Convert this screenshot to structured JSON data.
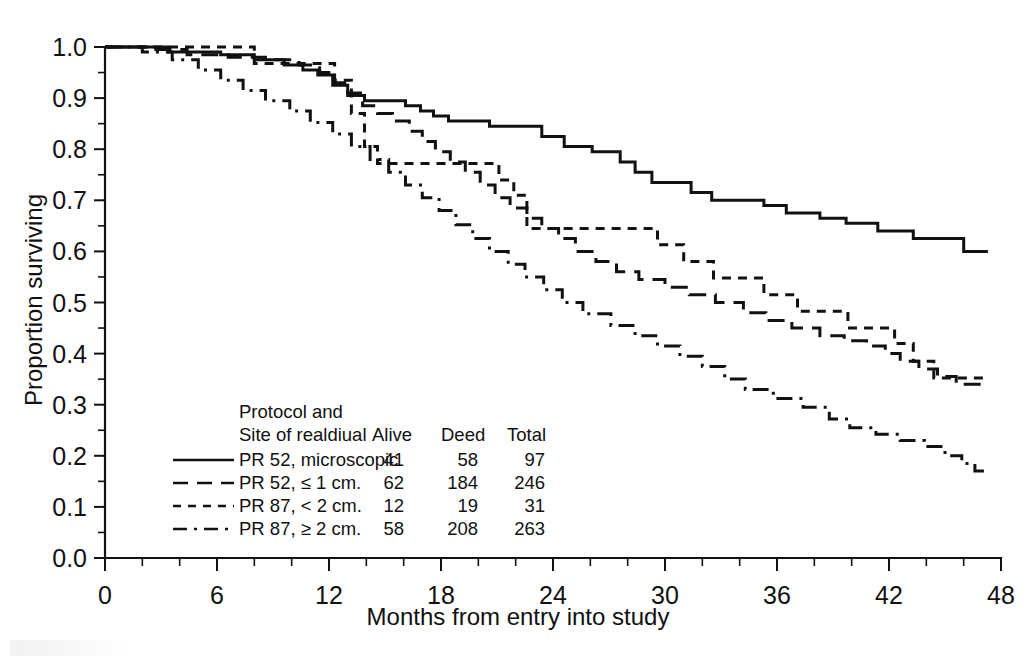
{
  "chart_data": {
    "type": "line",
    "title": "",
    "xlabel": "Months from entry into study",
    "ylabel": "Proportion surviving",
    "xlim": [
      0,
      48
    ],
    "ylim": [
      0.0,
      1.0
    ],
    "xticks": [
      0,
      6,
      12,
      18,
      24,
      30,
      36,
      42,
      48
    ],
    "xtick_labels": [
      "0",
      "6",
      "12",
      "18",
      "24",
      "30",
      "36",
      "42",
      "48"
    ],
    "x_minor_step": 2,
    "yticks": [
      0.0,
      0.1,
      0.2,
      0.3,
      0.4,
      0.5,
      0.6,
      0.7,
      0.8,
      0.9,
      1.0
    ],
    "ytick_labels": [
      "0.0",
      "0.1",
      "0.2",
      "0.3",
      "0.4",
      "0.5",
      "0.6",
      "0.7",
      "0.8",
      "0.9",
      "1.0"
    ],
    "y_minor_step": 0.05,
    "grid": false,
    "legend_position": "lower-left-inset",
    "series": [
      {
        "name": "PR 52, microscopic",
        "style": "solid",
        "points": [
          [
            0,
            1.0
          ],
          [
            3.4,
            1.0
          ],
          [
            3.4,
            0.99
          ],
          [
            6.2,
            0.99
          ],
          [
            6.2,
            0.985
          ],
          [
            8.0,
            0.985
          ],
          [
            8.0,
            0.975
          ],
          [
            9.6,
            0.975
          ],
          [
            9.6,
            0.965
          ],
          [
            10.6,
            0.965
          ],
          [
            10.6,
            0.955
          ],
          [
            11.4,
            0.955
          ],
          [
            11.4,
            0.945
          ],
          [
            12.2,
            0.945
          ],
          [
            12.2,
            0.925
          ],
          [
            13.0,
            0.925
          ],
          [
            13.0,
            0.905
          ],
          [
            13.9,
            0.905
          ],
          [
            13.9,
            0.895
          ],
          [
            16.1,
            0.895
          ],
          [
            16.1,
            0.885
          ],
          [
            16.9,
            0.885
          ],
          [
            16.9,
            0.875
          ],
          [
            17.6,
            0.875
          ],
          [
            17.6,
            0.865
          ],
          [
            18.4,
            0.865
          ],
          [
            18.4,
            0.855
          ],
          [
            20.6,
            0.855
          ],
          [
            20.6,
            0.845
          ],
          [
            23.4,
            0.845
          ],
          [
            23.4,
            0.825
          ],
          [
            24.6,
            0.825
          ],
          [
            24.6,
            0.805
          ],
          [
            26.1,
            0.805
          ],
          [
            26.1,
            0.795
          ],
          [
            27.6,
            0.795
          ],
          [
            27.6,
            0.775
          ],
          [
            28.4,
            0.775
          ],
          [
            28.4,
            0.755
          ],
          [
            29.3,
            0.755
          ],
          [
            29.3,
            0.735
          ],
          [
            31.4,
            0.735
          ],
          [
            31.4,
            0.715
          ],
          [
            32.5,
            0.715
          ],
          [
            32.5,
            0.7
          ],
          [
            35.3,
            0.7
          ],
          [
            35.3,
            0.69
          ],
          [
            36.5,
            0.69
          ],
          [
            36.5,
            0.675
          ],
          [
            38.3,
            0.675
          ],
          [
            38.3,
            0.665
          ],
          [
            39.7,
            0.665
          ],
          [
            39.7,
            0.655
          ],
          [
            41.4,
            0.655
          ],
          [
            41.4,
            0.64
          ],
          [
            43.3,
            0.64
          ],
          [
            43.3,
            0.625
          ],
          [
            46.0,
            0.625
          ],
          [
            46.0,
            0.6
          ],
          [
            47.3,
            0.6
          ]
        ],
        "alive": 41,
        "dead": 58,
        "total": 97,
        "end_value": 0.6
      },
      {
        "name": "PR 52, ≤ 1 cm.",
        "style": "long-dash",
        "points": [
          [
            0,
            1.0
          ],
          [
            2.4,
            1.0
          ],
          [
            2.4,
            0.995
          ],
          [
            4.4,
            0.995
          ],
          [
            4.4,
            0.985
          ],
          [
            6.6,
            0.985
          ],
          [
            6.6,
            0.98
          ],
          [
            8.6,
            0.98
          ],
          [
            8.6,
            0.975
          ],
          [
            10.4,
            0.975
          ],
          [
            10.4,
            0.965
          ],
          [
            11.5,
            0.965
          ],
          [
            11.5,
            0.95
          ],
          [
            12.3,
            0.95
          ],
          [
            12.3,
            0.93
          ],
          [
            13.0,
            0.93
          ],
          [
            13.0,
            0.91
          ],
          [
            13.8,
            0.91
          ],
          [
            13.8,
            0.885
          ],
          [
            14.6,
            0.885
          ],
          [
            14.6,
            0.87
          ],
          [
            15.4,
            0.87
          ],
          [
            15.4,
            0.855
          ],
          [
            16.3,
            0.855
          ],
          [
            16.3,
            0.835
          ],
          [
            17.0,
            0.835
          ],
          [
            17.0,
            0.815
          ],
          [
            17.7,
            0.815
          ],
          [
            17.7,
            0.795
          ],
          [
            18.5,
            0.795
          ],
          [
            18.5,
            0.775
          ],
          [
            19.3,
            0.775
          ],
          [
            19.3,
            0.755
          ],
          [
            20.1,
            0.755
          ],
          [
            20.1,
            0.73
          ],
          [
            20.9,
            0.73
          ],
          [
            20.9,
            0.705
          ],
          [
            21.7,
            0.705
          ],
          [
            21.7,
            0.685
          ],
          [
            22.6,
            0.685
          ],
          [
            22.6,
            0.665
          ],
          [
            23.4,
            0.665
          ],
          [
            23.4,
            0.645
          ],
          [
            24.3,
            0.645
          ],
          [
            24.3,
            0.625
          ],
          [
            25.2,
            0.625
          ],
          [
            25.2,
            0.6
          ],
          [
            26.3,
            0.6
          ],
          [
            26.3,
            0.58
          ],
          [
            27.4,
            0.58
          ],
          [
            27.4,
            0.56
          ],
          [
            28.6,
            0.56
          ],
          [
            28.6,
            0.545
          ],
          [
            30.0,
            0.545
          ],
          [
            30.0,
            0.53
          ],
          [
            31.3,
            0.53
          ],
          [
            31.3,
            0.515
          ],
          [
            32.7,
            0.515
          ],
          [
            32.7,
            0.5
          ],
          [
            34.2,
            0.5
          ],
          [
            34.2,
            0.48
          ],
          [
            35.4,
            0.48
          ],
          [
            35.4,
            0.465
          ],
          [
            36.8,
            0.465
          ],
          [
            36.8,
            0.45
          ],
          [
            38.3,
            0.45
          ],
          [
            38.3,
            0.435
          ],
          [
            39.6,
            0.435
          ],
          [
            39.6,
            0.425
          ],
          [
            40.8,
            0.425
          ],
          [
            40.8,
            0.415
          ],
          [
            41.8,
            0.415
          ],
          [
            41.8,
            0.4
          ],
          [
            42.6,
            0.4
          ],
          [
            42.6,
            0.385
          ],
          [
            43.6,
            0.385
          ],
          [
            43.6,
            0.37
          ],
          [
            44.6,
            0.37
          ],
          [
            44.6,
            0.355
          ],
          [
            45.6,
            0.355
          ],
          [
            45.6,
            0.34
          ],
          [
            47.3,
            0.34
          ]
        ],
        "alive": 62,
        "dead": 184,
        "total": 246,
        "end_value": 0.34
      },
      {
        "name": "PR 87, < 2 cm.",
        "style": "short-dash",
        "points": [
          [
            0,
            1.0
          ],
          [
            8.0,
            1.0
          ],
          [
            8.0,
            0.968
          ],
          [
            12.3,
            0.968
          ],
          [
            12.3,
            0.935
          ],
          [
            13.2,
            0.935
          ],
          [
            13.2,
            0.87
          ],
          [
            13.9,
            0.87
          ],
          [
            13.9,
            0.805
          ],
          [
            14.6,
            0.805
          ],
          [
            14.6,
            0.772
          ],
          [
            21.1,
            0.772
          ],
          [
            21.1,
            0.74
          ],
          [
            21.9,
            0.74
          ],
          [
            21.9,
            0.71
          ],
          [
            22.6,
            0.71
          ],
          [
            22.6,
            0.645
          ],
          [
            29.6,
            0.645
          ],
          [
            29.6,
            0.613
          ],
          [
            31.0,
            0.613
          ],
          [
            31.0,
            0.58
          ],
          [
            32.6,
            0.58
          ],
          [
            32.6,
            0.548
          ],
          [
            35.3,
            0.548
          ],
          [
            35.3,
            0.515
          ],
          [
            37.1,
            0.515
          ],
          [
            37.1,
            0.483
          ],
          [
            39.8,
            0.483
          ],
          [
            39.8,
            0.45
          ],
          [
            42.3,
            0.45
          ],
          [
            42.3,
            0.42
          ],
          [
            43.3,
            0.42
          ],
          [
            43.3,
            0.385
          ],
          [
            44.4,
            0.385
          ],
          [
            44.4,
            0.352
          ],
          [
            47.3,
            0.352
          ]
        ],
        "alive": 12,
        "dead": 19,
        "total": 31,
        "end_value": 0.35
      },
      {
        "name": "PR 87, ≥ 2 cm.",
        "style": "dash-dot",
        "points": [
          [
            0,
            1.0
          ],
          [
            2.0,
            1.0
          ],
          [
            2.0,
            0.99
          ],
          [
            3.6,
            0.99
          ],
          [
            3.6,
            0.975
          ],
          [
            5.0,
            0.975
          ],
          [
            5.0,
            0.955
          ],
          [
            6.2,
            0.955
          ],
          [
            6.2,
            0.935
          ],
          [
            7.4,
            0.935
          ],
          [
            7.4,
            0.915
          ],
          [
            8.6,
            0.915
          ],
          [
            8.6,
            0.895
          ],
          [
            9.9,
            0.895
          ],
          [
            9.9,
            0.875
          ],
          [
            11.0,
            0.875
          ],
          [
            11.0,
            0.852
          ],
          [
            12.2,
            0.852
          ],
          [
            12.2,
            0.83
          ],
          [
            13.2,
            0.83
          ],
          [
            13.2,
            0.805
          ],
          [
            14.2,
            0.805
          ],
          [
            14.2,
            0.78
          ],
          [
            15.2,
            0.78
          ],
          [
            15.2,
            0.755
          ],
          [
            16.1,
            0.755
          ],
          [
            16.1,
            0.73
          ],
          [
            17.0,
            0.73
          ],
          [
            17.0,
            0.705
          ],
          [
            17.9,
            0.705
          ],
          [
            17.9,
            0.68
          ],
          [
            18.8,
            0.68
          ],
          [
            18.8,
            0.652
          ],
          [
            19.7,
            0.652
          ],
          [
            19.7,
            0.625
          ],
          [
            20.6,
            0.625
          ],
          [
            20.6,
            0.6
          ],
          [
            21.6,
            0.6
          ],
          [
            21.6,
            0.575
          ],
          [
            22.5,
            0.575
          ],
          [
            22.5,
            0.55
          ],
          [
            23.5,
            0.55
          ],
          [
            23.5,
            0.525
          ],
          [
            24.5,
            0.525
          ],
          [
            24.5,
            0.5
          ],
          [
            25.6,
            0.5
          ],
          [
            25.6,
            0.478
          ],
          [
            27.1,
            0.478
          ],
          [
            27.1,
            0.455
          ],
          [
            28.4,
            0.455
          ],
          [
            28.4,
            0.435
          ],
          [
            29.6,
            0.435
          ],
          [
            29.6,
            0.415
          ],
          [
            30.8,
            0.415
          ],
          [
            30.8,
            0.395
          ],
          [
            32.0,
            0.395
          ],
          [
            32.0,
            0.375
          ],
          [
            33.2,
            0.375
          ],
          [
            33.2,
            0.35
          ],
          [
            34.3,
            0.35
          ],
          [
            34.3,
            0.33
          ],
          [
            35.8,
            0.33
          ],
          [
            35.8,
            0.312
          ],
          [
            37.4,
            0.312
          ],
          [
            37.4,
            0.295
          ],
          [
            38.8,
            0.295
          ],
          [
            38.8,
            0.272
          ],
          [
            39.9,
            0.272
          ],
          [
            39.9,
            0.255
          ],
          [
            41.3,
            0.255
          ],
          [
            41.3,
            0.242
          ],
          [
            42.6,
            0.242
          ],
          [
            42.6,
            0.23
          ],
          [
            43.9,
            0.23
          ],
          [
            43.9,
            0.218
          ],
          [
            45.0,
            0.218
          ],
          [
            45.0,
            0.2
          ],
          [
            45.9,
            0.2
          ],
          [
            45.9,
            0.185
          ],
          [
            46.6,
            0.185
          ],
          [
            46.6,
            0.17
          ],
          [
            47.4,
            0.17
          ]
        ],
        "alive": 58,
        "dead": 208,
        "total": 263,
        "end_value": 0.17
      }
    ]
  },
  "legend": {
    "header_line1": "Protocol and",
    "header_line2": "Site of realdiual",
    "columns": [
      "Alive",
      "Deed",
      "Total"
    ],
    "rows": [
      {
        "style": "solid",
        "label": "PR 52, microscopic",
        "alive": "41",
        "dead": "58",
        "total": "97"
      },
      {
        "style": "long-dash",
        "label": "PR 52, ≤ 1 cm.",
        "alive": "62",
        "dead": "184",
        "total": "246"
      },
      {
        "style": "short-dash",
        "label": "PR 87, < 2 cm.",
        "alive": "12",
        "dead": "19",
        "total": "31"
      },
      {
        "style": "dash-dot",
        "label": "PR 87, ≥ 2 cm.",
        "alive": "58",
        "dead": "208",
        "total": "263"
      }
    ]
  },
  "axes": {
    "x_title": "Months from entry into study",
    "y_title": "Proportion surviving"
  },
  "colors": {
    "ink": "#111111",
    "background": "#ffffff"
  }
}
